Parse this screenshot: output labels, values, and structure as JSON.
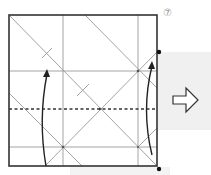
{
  "diagram": {
    "type": "origami-fold-step",
    "step_number": "⑦",
    "paper": {
      "x": 9,
      "y": 15,
      "width": 148,
      "height": 151,
      "border_color": "#333333"
    },
    "crease_color": "#999999",
    "valley_fold_line": {
      "style": "dashed",
      "y": 109,
      "color": "#333333"
    },
    "reference_dots": [
      {
        "x": 157,
        "y": 52
      },
      {
        "x": 157,
        "y": 169
      }
    ],
    "fold_arrows": [
      {
        "name": "left-fold-arrow",
        "direction": "up"
      },
      {
        "name": "right-fold-arrow",
        "direction": "up"
      }
    ],
    "next_step_arrow": {
      "direction": "right",
      "icon": "hollow-arrow-right"
    },
    "shading": {
      "color": "#f0f0f0"
    }
  }
}
